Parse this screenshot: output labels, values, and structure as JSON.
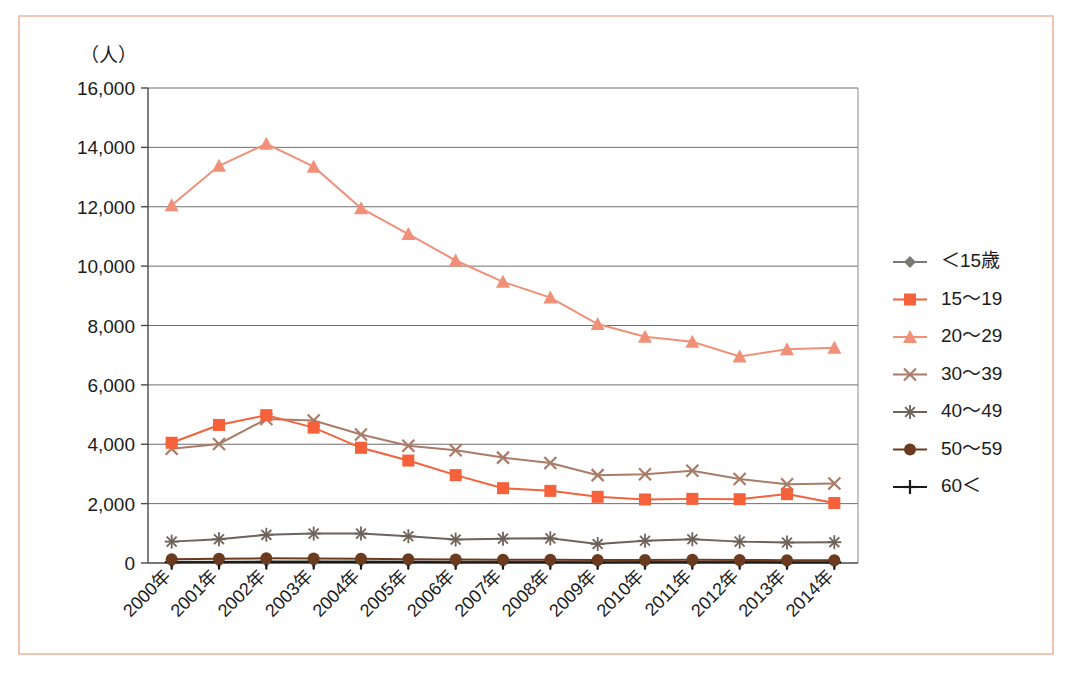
{
  "figure": {
    "frame_color": "#f3c3b4",
    "background": "#ffffff"
  },
  "chart_data": {
    "type": "line",
    "title": "",
    "subtitle": "",
    "xlabel": "",
    "ylabel": "（人）",
    "ylim": [
      0,
      16000
    ],
    "ytick_labels": [
      "0",
      "2,000",
      "4,000",
      "6,000",
      "8,000",
      "10,000",
      "12,000",
      "14,000",
      "16,000"
    ],
    "ytick_values": [
      0,
      2000,
      4000,
      6000,
      8000,
      10000,
      12000,
      14000,
      16000
    ],
    "grid": true,
    "legend_position": "right",
    "categories": [
      "2000年",
      "2001年",
      "2002年",
      "2003年",
      "2004年",
      "2005年",
      "2006年",
      "2007年",
      "2008年",
      "2009年",
      "2010年",
      "2011年",
      "2012年",
      "2013年",
      "2014年"
    ],
    "series": [
      {
        "name": "＜15歳",
        "color": "#7a7a72",
        "marker": "diamond",
        "values": [
          40,
          45,
          55,
          60,
          55,
          50,
          45,
          40,
          40,
          35,
          35,
          40,
          35,
          30,
          30
        ]
      },
      {
        "name": "15〜19",
        "color": "#f4613a",
        "marker": "square",
        "values": [
          4050,
          4650,
          4980,
          4560,
          3880,
          3450,
          2960,
          2520,
          2430,
          2230,
          2140,
          2160,
          2150,
          2320,
          2020
        ]
      },
      {
        "name": "20〜29",
        "color": "#f09078",
        "marker": "triangle",
        "values": [
          12050,
          13380,
          14120,
          13350,
          11950,
          11080,
          10190,
          9470,
          8940,
          8050,
          7620,
          7450,
          6960,
          7200,
          7250
        ]
      },
      {
        "name": "30〜39",
        "color": "#a87c68",
        "marker": "x",
        "values": [
          3850,
          4010,
          4850,
          4800,
          4330,
          3950,
          3800,
          3550,
          3370,
          2960,
          2990,
          3110,
          2830,
          2650,
          2680
        ]
      },
      {
        "name": "40〜49",
        "color": "#6e625a",
        "marker": "asterisk",
        "values": [
          720,
          800,
          950,
          990,
          990,
          900,
          790,
          820,
          830,
          640,
          750,
          800,
          720,
          690,
          700
        ]
      },
      {
        "name": "50〜59",
        "color": "#6b3b1f",
        "marker": "circle",
        "values": [
          130,
          140,
          160,
          150,
          140,
          130,
          120,
          110,
          110,
          100,
          100,
          110,
          100,
          95,
          90
        ]
      },
      {
        "name": "60＜",
        "color": "#1a1a1a",
        "marker": "plus",
        "values": [
          25,
          30,
          35,
          35,
          30,
          30,
          25,
          25,
          25,
          20,
          25,
          25,
          25,
          20,
          20
        ]
      }
    ]
  }
}
